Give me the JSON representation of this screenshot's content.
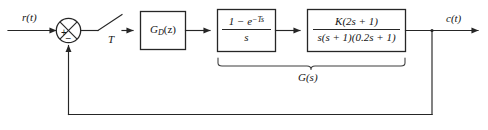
{
  "diagram": {
    "type": "control-system-block-diagram",
    "width": 488,
    "height": 130,
    "background_color": "#ffffff",
    "line_color": "#262626",
    "text_color": "#141414"
  },
  "signals": {
    "input_label": "r(t)",
    "output_label": "c(t)",
    "sampling_period_label": "T"
  },
  "summing_junction": {
    "name": "summing-junction",
    "positive_sign": "+",
    "negative_sign": "−",
    "positive_input": "r(t)",
    "negative_input": "c(t) feedback"
  },
  "sampler": {
    "name": "sampler-switch",
    "label": "T",
    "description": "ideal sampler, period T"
  },
  "blocks": [
    {
      "id": "digital-controller",
      "name": "block-digital-controller",
      "form": "inline",
      "text": "G",
      "subscript": "D",
      "suffix": "(z)",
      "full_text": "G_D(z)"
    },
    {
      "id": "zero-order-hold",
      "name": "block-zero-order-hold",
      "form": "fraction",
      "numerator_prefix": "1 − e",
      "numerator_exponent": "−Ts",
      "denominator": "s",
      "full_text": "(1 - e^(-Ts)) / s"
    },
    {
      "id": "plant",
      "name": "block-plant",
      "form": "fraction",
      "numerator": "K(2s + 1)",
      "denominator": "s(s + 1)(0.2s + 1)",
      "full_text": "K(2s + 1) / [s(s + 1)(0.2s + 1)]"
    }
  ],
  "brace": {
    "name": "brace-continuous-plant",
    "label": "G(s)",
    "spans": [
      "zero-order-hold",
      "plant"
    ]
  },
  "feedback": {
    "name": "feedback-path",
    "gain": "unity",
    "description": "unity negative feedback from c(t) to summing junction"
  }
}
